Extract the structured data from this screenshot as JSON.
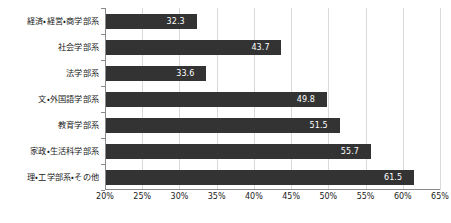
{
  "chart_data": {
    "type": "bar",
    "orientation": "horizontal",
    "title": "",
    "subtitle": "",
    "xlabel": "",
    "ylabel": "",
    "xlim": [
      20,
      65
    ],
    "xtick_step": 5,
    "grid": true,
    "legend": false,
    "value_suffix": "",
    "bar_color": "#333333",
    "label_color": "#ffffff",
    "gridline_color": "#d9d9d9",
    "axis_color": "#8a8a8a",
    "categories": [
      "経済・経営・商学部系",
      "社会学部系",
      "法学部系",
      "文・外国語学部系",
      "教育学部系",
      "家政・生活科学部系",
      "理・工学部系・その他"
    ],
    "values": [
      32.3,
      43.7,
      33.6,
      49.8,
      51.5,
      55.7,
      61.5
    ],
    "value_labels": [
      "32.3",
      "43.7",
      "33.6",
      "49.8",
      "51.5",
      "55.7",
      "61.5"
    ],
    "xticks": [
      20,
      25,
      30,
      35,
      40,
      45,
      50,
      55,
      60,
      65
    ],
    "xtick_labels": [
      "20%",
      "25%",
      "30%",
      "35%",
      "40%",
      "45%",
      "50%",
      "55%",
      "60%",
      "65%"
    ]
  }
}
